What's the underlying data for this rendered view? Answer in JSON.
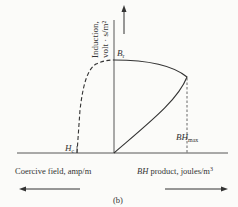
{
  "figure": {
    "caption": "(b)",
    "y_axis_label_line1": "Induction,",
    "y_axis_label_line2": "volt · s/m²",
    "br_label": "B",
    "br_sub": "r",
    "hc_label": "H",
    "hc_sub": "c",
    "bhmax_label": "BH",
    "bhmax_sub": "max",
    "left_axis_label": "Coercive field, amp/m",
    "right_axis_label_italic": "BH",
    "right_axis_label_rest": " product, joules/m",
    "right_axis_label_sup": "3"
  },
  "colors": {
    "ink": "#333333",
    "background": "#fbfbf9"
  }
}
